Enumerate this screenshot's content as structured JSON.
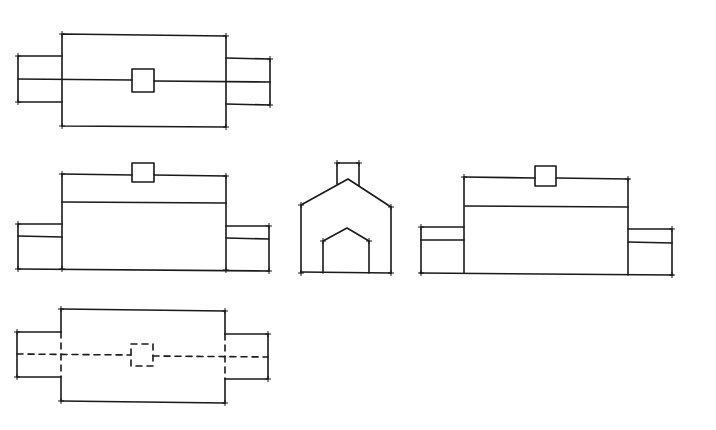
{
  "views": [
    {
      "id": "plan-top",
      "label": "Top plan view"
    },
    {
      "id": "front-elevation",
      "label": "Front elevation"
    },
    {
      "id": "side-elevation",
      "label": "Side elevation"
    },
    {
      "id": "rear-elevation",
      "label": "Rear elevation"
    },
    {
      "id": "plan-bottom",
      "label": "Bottom plan view (hidden lines)"
    }
  ],
  "line_color": "#1a1a1a",
  "background": "#ffffff"
}
